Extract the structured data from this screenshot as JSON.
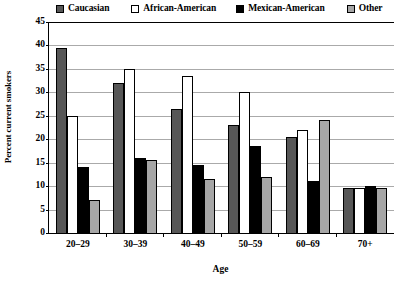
{
  "chart_data": {
    "type": "bar",
    "title": "",
    "xlabel": "Age",
    "ylabel": "Percent current smokers",
    "categories": [
      "20–29",
      "30–39",
      "40–49",
      "50–59",
      "60–69",
      "70+"
    ],
    "series": [
      {
        "name": "Caucasian",
        "color": "#575757",
        "values": [
          39.5,
          32.0,
          26.5,
          23.0,
          20.5,
          9.5
        ]
      },
      {
        "name": "African-American",
        "color": "#ffffff",
        "values": [
          25.0,
          35.0,
          33.5,
          30.0,
          22.0,
          9.5
        ]
      },
      {
        "name": "Mexican-American",
        "color": "#000000",
        "values": [
          14.0,
          16.0,
          14.5,
          18.5,
          11.0,
          10.0
        ]
      },
      {
        "name": "Other",
        "color": "#a6a6a6",
        "values": [
          7.0,
          15.5,
          11.5,
          12.0,
          24.0,
          9.5
        ]
      }
    ],
    "ylim": [
      0,
      45
    ],
    "yticks": [
      0,
      5,
      10,
      15,
      20,
      25,
      30,
      35,
      40,
      45
    ],
    "grid": true,
    "legend_position": "top"
  }
}
